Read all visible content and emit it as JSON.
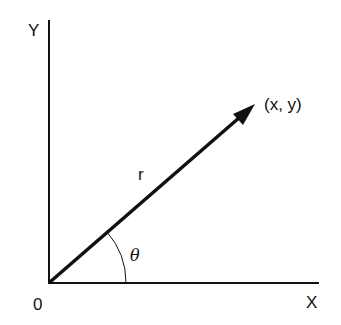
{
  "diagram": {
    "labels": {
      "y_axis": "Y",
      "x_axis": "X",
      "origin": "0",
      "point": "(x, y)",
      "radius": "r",
      "angle": "θ"
    },
    "colors": {
      "stroke": "#111111",
      "background": "#ffffff"
    },
    "geometry": {
      "origin": [
        49,
        283
      ],
      "y_axis_top": [
        49,
        20
      ],
      "x_axis_end": [
        319,
        283
      ],
      "vector_tip": [
        255,
        104
      ],
      "arc_radius": 77
    }
  }
}
